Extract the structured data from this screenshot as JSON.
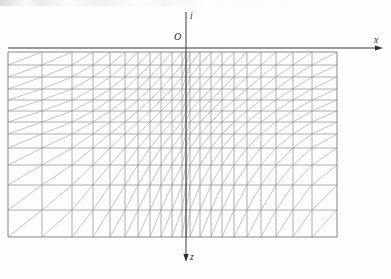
{
  "figure": {
    "kind": "finite-element-mesh-diagram",
    "background_color": "#fdfdfc",
    "line_color": "#7e7e82",
    "diagonal_color": "#96969a",
    "axis_color": "#3a3a3a",
    "label_color": "#2b2b2b"
  },
  "axes": {
    "origin_label": "O",
    "horizontal": {
      "name": "x-axis",
      "label": "x",
      "direction": "right",
      "arrow": true,
      "y_px": 48,
      "x_start_px": 8,
      "x_end_px": 383
    },
    "vertical_up": {
      "name": "i-axis",
      "label": "i",
      "direction": "up",
      "arrow": false,
      "x_px": 186,
      "y_start_px": 48,
      "y_end_px": 12
    },
    "vertical_down": {
      "name": "z-axis",
      "label": "z",
      "direction": "down",
      "arrow": true,
      "x_px": 186,
      "y_start_px": 48,
      "y_end_px": 262
    }
  },
  "mesh": {
    "left_px": 8,
    "right_px": 337,
    "top_px": 52,
    "bottom_px": 237,
    "columns": 24,
    "rows": 10,
    "diagonal_direction": "bottom-left-to-top-right",
    "x_nodes": [
      8,
      42,
      72,
      93,
      110,
      125,
      138,
      150,
      161,
      172,
      182,
      186,
      190,
      200,
      211,
      222,
      234,
      247,
      261,
      276,
      293,
      312,
      337
    ],
    "y_nodes": [
      52,
      65,
      77,
      89,
      100,
      111,
      122,
      134,
      148,
      165,
      185,
      210,
      237
    ]
  },
  "labels": {
    "x": "x",
    "i": "i",
    "z": "z",
    "origin": "O"
  }
}
